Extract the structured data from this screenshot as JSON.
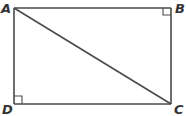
{
  "diagram": {
    "type": "geometry",
    "shape": "rectangle",
    "vertices": {
      "A": {
        "label": "A",
        "x": 14,
        "y": 8
      },
      "B": {
        "label": "B",
        "x": 171,
        "y": 8
      },
      "C": {
        "label": "C",
        "x": 171,
        "y": 104
      },
      "D": {
        "label": "D",
        "x": 14,
        "y": 104
      }
    },
    "segments": [
      "AB",
      "BC",
      "CD",
      "DA",
      "AC"
    ],
    "diagonal": "AC",
    "right_angle_marks": [
      "B",
      "D"
    ],
    "colors": {
      "stroke": "#4a4a4a",
      "label": "#333333",
      "background": "#ffffff"
    }
  }
}
